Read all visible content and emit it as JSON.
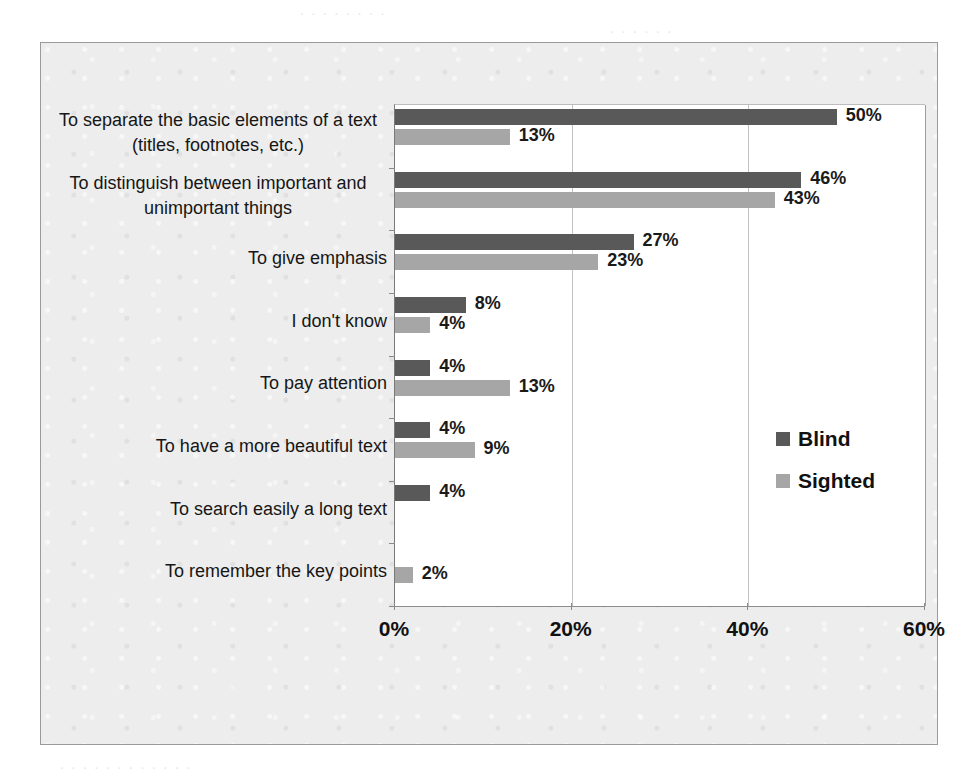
{
  "chart_data": {
    "type": "bar",
    "orientation": "horizontal",
    "title": "",
    "xlabel": "",
    "ylabel": "",
    "xlim": [
      0,
      60
    ],
    "xticks": [
      "0%",
      "20%",
      "40%",
      "60%"
    ],
    "xtick_values": [
      0,
      20,
      40,
      60
    ],
    "grid": true,
    "legend_position": "center-right",
    "categories": [
      "To separate the basic elements of a text (titles, footnotes, etc.)",
      "To distinguish between important and unimportant things",
      "To give emphasis",
      "I don't know",
      "To pay attention",
      "To have a more beautiful text",
      "To search easily a long text",
      "To remember the key points"
    ],
    "category_lines": [
      [
        "To separate the basic elements of a text",
        "(titles, footnotes, etc.)"
      ],
      [
        "To distinguish between important and",
        "unimportant things"
      ],
      [
        "To give emphasis"
      ],
      [
        "I don't know"
      ],
      [
        "To pay attention"
      ],
      [
        "To have a more beautiful text"
      ],
      [
        "To search easily a long text"
      ],
      [
        "To remember the key points"
      ]
    ],
    "series": [
      {
        "name": "Blind",
        "color": "#595959",
        "values": [
          50,
          46,
          27,
          8,
          4,
          4,
          4,
          null
        ],
        "labels": [
          "50%",
          "46%",
          "27%",
          "8%",
          "4%",
          "4%",
          "4%",
          ""
        ]
      },
      {
        "name": "Sighted",
        "color": "#a6a6a6",
        "values": [
          13,
          43,
          23,
          4,
          13,
          9,
          null,
          2
        ],
        "labels": [
          "13%",
          "43%",
          "23%",
          "4%",
          "13%",
          "9%",
          "",
          "2%"
        ]
      }
    ]
  },
  "legend": {
    "items": [
      {
        "label": "Blind",
        "color": "#595959"
      },
      {
        "label": "Sighted",
        "color": "#a6a6a6"
      }
    ]
  },
  "colors": {
    "blind": "#595959",
    "sighted": "#a6a6a6",
    "plot_background": "#ffffff",
    "chart_background": "#ededed",
    "frame_border": "#9a9a9a",
    "gridline": "#c2c2c2"
  }
}
